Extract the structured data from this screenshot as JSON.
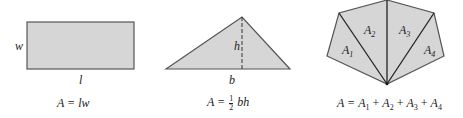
{
  "figures": [
    {
      "shape": "rectangle",
      "labels": {
        "side": "w",
        "base": "l"
      },
      "formula": "A = lw"
    },
    {
      "shape": "triangle",
      "labels": {
        "height": "h",
        "base": "b"
      },
      "formula": "A = ½ bh",
      "formula_parts": {
        "lhs": "A =",
        "num": "1",
        "den": "2",
        "rhs": "bh"
      }
    },
    {
      "shape": "polygon",
      "labels": {
        "r1": "A",
        "s1": "1",
        "r2": "A",
        "s2": "2",
        "r3": "A",
        "s3": "3",
        "r4": "A",
        "s4": "4"
      },
      "formula": "A = A1 + A2 + A3 + A4",
      "formula_parts": {
        "lhs": "A =",
        "t": "A",
        "s1": "1",
        "s2": "2",
        "s3": "3",
        "s4": "4",
        "plus": "+"
      }
    }
  ],
  "colors": {
    "fill": "#d6d6d6",
    "stroke": "#333333"
  }
}
